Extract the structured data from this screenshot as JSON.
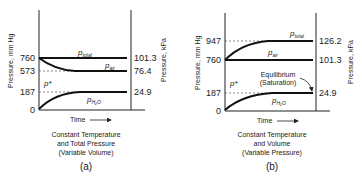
{
  "panels": [
    {
      "id": "a",
      "label": "(a)",
      "caption": [
        "Constant Temperature",
        "and Total Pressure",
        "(Variable Volume)"
      ],
      "left_axis_label": "Pressure, mm Hg",
      "right_axis_label": "Pressure, kPa",
      "x_axis_label": "Time",
      "left_ticks": [
        "760",
        "573",
        "187",
        "0"
      ],
      "right_ticks": [
        "101.3",
        "76.4",
        "24.9"
      ],
      "curves": {
        "total": "p",
        "total_sub": "total",
        "air": "p",
        "air_sub": "air",
        "h2o": "p",
        "h2o_sub": "H₂O",
        "pstar": "p*"
      }
    },
    {
      "id": "b",
      "label": "(b)",
      "caption": [
        "Constant Temperature",
        "and Volume",
        "(Variable Pressure)"
      ],
      "left_axis_label": "Pressure, mm Hg",
      "right_axis_label": "Pressure, kPa",
      "x_axis_label": "Time",
      "left_ticks": [
        "947",
        "760",
        "187",
        "0"
      ],
      "right_ticks": [
        "126.2",
        "101.3",
        "24.9"
      ],
      "annotation": [
        "Equilibrium",
        "(Saturation)"
      ],
      "curves": {
        "total": "p",
        "total_sub": "total",
        "air": "p",
        "air_sub": "air",
        "h2o": "p",
        "h2o_sub": "H₂O",
        "pstar": "p*"
      }
    }
  ]
}
